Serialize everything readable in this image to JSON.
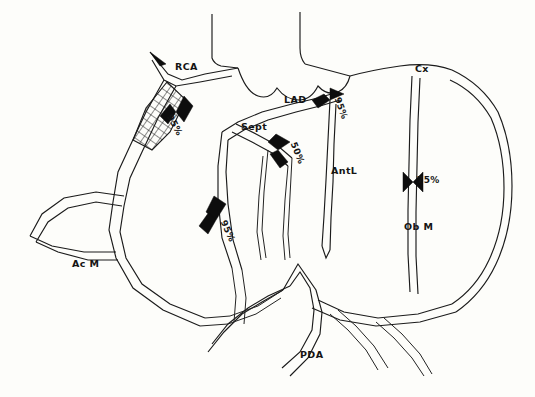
{
  "figure": {
    "background_color": "#fdfdfa",
    "ink_color": "#1b1b1b"
  },
  "vessel_labels": [
    {
      "id": "rca",
      "text": "RCA",
      "x": 175,
      "y": 68,
      "rotation": 0
    },
    {
      "id": "cx",
      "text": "Cx",
      "x": 415,
      "y": 70,
      "rotation": 0
    },
    {
      "id": "lad",
      "text": "LAD",
      "x": 284,
      "y": 100,
      "rotation": 0
    },
    {
      "id": "sept",
      "text": "Sept",
      "x": 241,
      "y": 128,
      "rotation": 0
    },
    {
      "id": "antl",
      "text": "AntL",
      "x": 331,
      "y": 170,
      "rotation": 0
    },
    {
      "id": "obm",
      "text": "Ob M",
      "x": 404,
      "y": 227,
      "rotation": 0
    },
    {
      "id": "acm",
      "text": "Ac M",
      "x": 72,
      "y": 264,
      "rotation": 0
    },
    {
      "id": "pda",
      "text": "PDA",
      "x": 300,
      "y": 355,
      "rotation": 0
    }
  ],
  "stenosis_labels": [
    {
      "id": "rca-prox-95",
      "vessel": "RCA",
      "value": "95%",
      "x": 173,
      "y": 113,
      "rotation": 62
    },
    {
      "id": "lad-prox-95",
      "vessel": "LAD",
      "value": "95%",
      "x": 341,
      "y": 96,
      "rotation": 70
    },
    {
      "id": "sept-50",
      "vessel": "Sept",
      "value": "50%",
      "x": 297,
      "y": 141,
      "rotation": 68
    },
    {
      "id": "rca-dist-95",
      "vessel": "RCA",
      "value": "95%",
      "x": 227,
      "y": 219,
      "rotation": 66
    },
    {
      "id": "obm-75",
      "vessel": "Ob M",
      "value": "75%",
      "x": 417,
      "y": 181,
      "rotation": 0
    }
  ],
  "legend_note": {
    "diffuse_disease": "crosshatched segment",
    "focal_lesion": "solid black tapered narrowing"
  }
}
